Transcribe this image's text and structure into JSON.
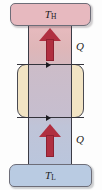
{
  "figure": {
    "type": "thermodynamics-heat-transfer-diagram",
    "width": 102,
    "height": 190
  },
  "hot_reservoir": {
    "symbol": "T",
    "subscript": "H",
    "name": "high-temperature-reservoir",
    "color": "#e7b9bf"
  },
  "cold_reservoir": {
    "symbol": "T",
    "subscript": "L",
    "name": "low-temperature-reservoir",
    "color": "#b9cbe2"
  },
  "heat_labels": {
    "upper": "Q",
    "lower": "Q"
  },
  "arrows": {
    "upper_direction": "up",
    "lower_direction": "up",
    "color": "#b02f40"
  },
  "device": {
    "name": "working-device",
    "color": "#f2e4c4"
  },
  "flow_markers": {
    "top_direction": "right",
    "bottom_direction": "right",
    "color": "#1a1a1f"
  },
  "column": {
    "name": "conduit",
    "gradient_top_color": "#e9bcc0",
    "gradient_bottom_color": "#b9c6dd"
  }
}
